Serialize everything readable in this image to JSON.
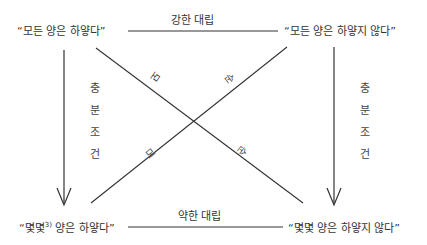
{
  "corners": {
    "top_left": "“모든 양은 하얗다”",
    "top_right": "“모든 양은 하얗지 않다”",
    "bottom_left_prefix": "“몇몇",
    "bottom_left_footnote": "3)",
    "bottom_left_suffix": " 양은 하얗다”",
    "bottom_right": "“몇몇 양은 하얗지 않다”"
  },
  "relations": {
    "top": "강한 대립",
    "bottom": "약한 대립",
    "left_vertical": [
      "충",
      "분",
      "조",
      "건"
    ],
    "right_vertical": [
      "충",
      "분",
      "조",
      "건"
    ],
    "diagonal_labels": {
      "desc_upper": "모",
      "desc_lower": "순",
      "asc_upper": "순",
      "asc_lower": "모"
    }
  },
  "colors": {
    "line": "#333333",
    "text": "#333333"
  }
}
